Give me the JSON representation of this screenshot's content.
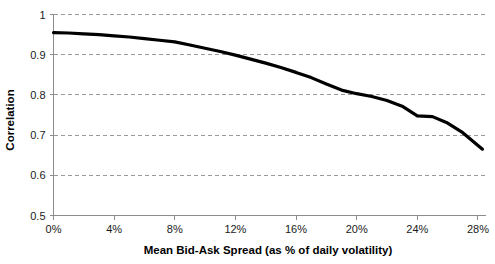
{
  "chart_data": {
    "type": "line",
    "title": "",
    "xlabel": "Mean Bid-Ask Spread (as % of daily volatility)",
    "ylabel": "Correlation",
    "xlim": [
      0,
      28.5
    ],
    "ylim": [
      0.5,
      1.0
    ],
    "grid": true,
    "grid_axis": "y",
    "legend": "none",
    "x_tick_labels": [
      "0%",
      "4%",
      "8%",
      "12%",
      "16%",
      "20%",
      "24%",
      "28%"
    ],
    "x_tick_values": [
      0,
      4,
      8,
      12,
      16,
      20,
      24,
      28
    ],
    "y_tick_labels": [
      "0.5",
      "0.6",
      "0.7",
      "0.8",
      "0.9",
      "1"
    ],
    "y_tick_values": [
      0.5,
      0.6,
      0.7,
      0.8,
      0.9,
      1.0
    ],
    "series": [
      {
        "name": "Correlation",
        "color": "#000000",
        "x": [
          0.0,
          1.0,
          2.0,
          3.0,
          4.0,
          5.0,
          6.0,
          7.0,
          8.0,
          9.0,
          10.0,
          11.0,
          12.0,
          13.0,
          14.0,
          15.0,
          16.0,
          17.0,
          18.0,
          19.0,
          20.0,
          21.0,
          22.0,
          23.0,
          24.0,
          25.0,
          26.0,
          27.0,
          28.3
        ],
        "y": [
          0.955,
          0.954,
          0.952,
          0.95,
          0.947,
          0.944,
          0.94,
          0.936,
          0.932,
          0.924,
          0.916,
          0.908,
          0.899,
          0.889,
          0.879,
          0.868,
          0.856,
          0.843,
          0.827,
          0.812,
          0.803,
          0.796,
          0.786,
          0.772,
          0.748,
          0.746,
          0.73,
          0.706,
          0.665
        ]
      }
    ]
  }
}
